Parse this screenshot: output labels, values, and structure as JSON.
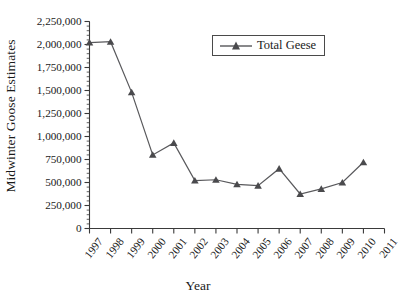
{
  "figure": {
    "background": "#ffffff",
    "line_color": "#59595c",
    "marker_color": "#4a4a4d",
    "text_color": "#1a1a1a"
  },
  "axes": {
    "ylabel": "Midwinter Goose Estimates",
    "xlabel": "Year"
  },
  "legend": {
    "entries": [
      {
        "label": "Total Geese",
        "marker": "triangle",
        "color": "#4a4a4d"
      }
    ]
  },
  "chart_data": {
    "type": "line",
    "title": "",
    "xlabel": "Year",
    "ylabel": "Midwinter Goose Estimates",
    "categories": [
      "1997",
      "1998",
      "1999",
      "2000",
      "2001",
      "2002",
      "2003",
      "2004",
      "2005",
      "2006",
      "2007",
      "2008",
      "2009",
      "2010",
      "2011"
    ],
    "series": [
      {
        "name": "Total Geese",
        "marker": "triangle",
        "color": "#4a4a4d",
        "values": [
          2020000,
          2030000,
          1480000,
          800000,
          930000,
          520000,
          530000,
          480000,
          465000,
          650000,
          375000,
          430000,
          500000,
          720000,
          null
        ]
      }
    ],
    "ylim": [
      0,
      2250000
    ],
    "yticks": [
      0,
      250000,
      500000,
      750000,
      1000000,
      1250000,
      1500000,
      1750000,
      2000000,
      2250000
    ],
    "ytick_labels": [
      "0",
      "250,000",
      "500,000",
      "750,000",
      "1,000,000",
      "1,250,000",
      "1,500,000",
      "1,750,000",
      "2,000,000",
      "2,250,000"
    ],
    "grid": false,
    "legend_position": "upper right",
    "minor_ticks": true
  }
}
